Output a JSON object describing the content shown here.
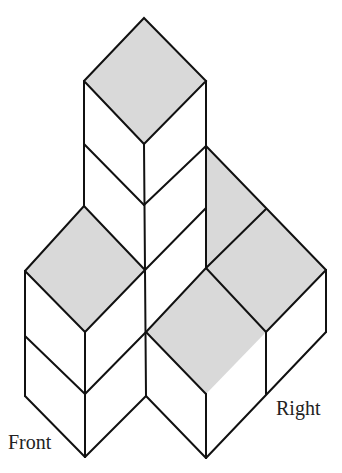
{
  "diagram": {
    "type": "isometric-cube-arrangement",
    "labels": {
      "front": "Front",
      "right": "Right"
    },
    "colors": {
      "top_face": "#d9d9d9",
      "edges": "#111111",
      "background": "#ffffff"
    },
    "cubes": [
      {
        "id": "tower-top",
        "column": "center-back",
        "level": 3,
        "top_shaded": true
      },
      {
        "id": "tower-mid",
        "column": "center-back",
        "level": 2,
        "top_shaded": false
      },
      {
        "id": "tower-base",
        "column": "center-back",
        "level": 1,
        "top_shaded": false
      },
      {
        "id": "left-upper",
        "column": "left-front",
        "level": 2,
        "top_shaded": true
      },
      {
        "id": "left-lower",
        "column": "left-front",
        "level": 1,
        "top_shaded": false
      },
      {
        "id": "right-back",
        "column": "right-back",
        "level": 1,
        "top_shaded": true
      },
      {
        "id": "right-mid",
        "column": "right",
        "level": 1,
        "top_shaded": true
      },
      {
        "id": "center-front",
        "column": "center-front",
        "level": 1,
        "top_shaded": true
      }
    ]
  }
}
